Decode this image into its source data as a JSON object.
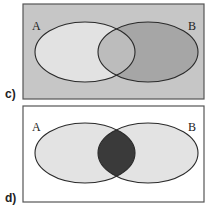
{
  "panels": [
    {
      "id": "c",
      "label": "c)",
      "set_a_label": "A",
      "set_b_label": "B",
      "shading": "B shaded, universe shaded",
      "colors": {
        "universe": "#c6c6c6",
        "a_only": "#e2e2e2",
        "b_only": "#a6a6a6",
        "intersection": "#bcbcbc",
        "stroke": "#2a2a2a"
      }
    },
    {
      "id": "d",
      "label": "d)",
      "set_a_label": "A",
      "set_b_label": "B",
      "shading": "A intersect B shaded",
      "colors": {
        "universe": "#ffffff",
        "a_only": "#e3e3e3",
        "b_only": "#e3e3e3",
        "intersection": "#3a3a3a",
        "stroke": "#2a2a2a"
      }
    }
  ]
}
